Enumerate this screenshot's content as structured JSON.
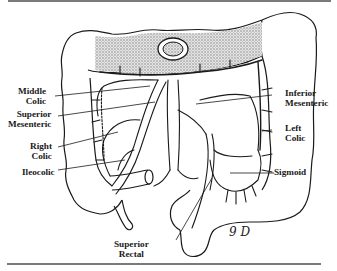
{
  "figure": {
    "labels": {
      "middle_colic": [
        "Middle",
        "Colic"
      ],
      "superior_mesenteric": [
        "Superior",
        "Mesenteric"
      ],
      "right_colic": [
        "Right",
        "Colic"
      ],
      "ileocolic": "Ileocolic",
      "inferior_mesenteric": [
        "Inferior",
        "Mesenteric"
      ],
      "left_colic": [
        "Left",
        "Colic"
      ],
      "sigmoid": "Sigmoid",
      "superior_rectal": [
        "Superior",
        "Rectal"
      ]
    },
    "artist_signature": "9 D"
  },
  "colors": {
    "ink": "#1a1a1a",
    "shading": "#c9c9c9",
    "rule": "#7a7a7a",
    "background": "#ffffff"
  }
}
